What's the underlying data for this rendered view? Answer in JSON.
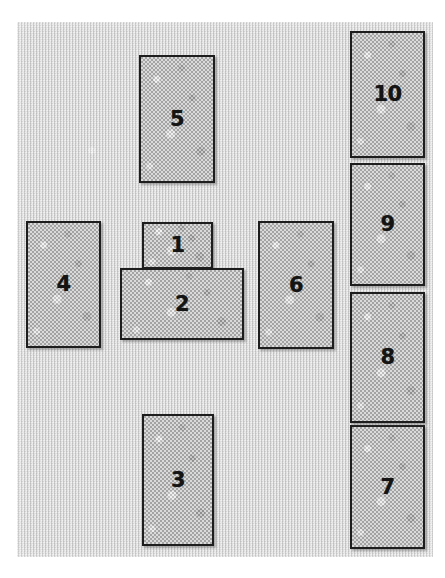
{
  "figure": {
    "canvas": {
      "width": 445,
      "height": 578
    },
    "colors": {
      "page_background": "#ffffff",
      "panel_fill": "#d6d6d6",
      "box_fill": "#b9b9b9",
      "box_border": "#1d1d1d",
      "label_text": "#141414"
    }
  },
  "panel": {
    "x": 17,
    "y": 22,
    "width": 416,
    "height": 535
  },
  "boxes": [
    {
      "id": "box-1",
      "label": "1",
      "x": 142,
      "y": 222,
      "width": 71,
      "height": 47,
      "overlap": false
    },
    {
      "id": "box-2",
      "label": "2",
      "x": 120,
      "y": 268,
      "width": 124,
      "height": 72,
      "overlap": true
    },
    {
      "id": "box-3",
      "label": "3",
      "x": 142,
      "y": 414,
      "width": 72,
      "height": 132,
      "overlap": false
    },
    {
      "id": "box-4",
      "label": "4",
      "x": 26,
      "y": 221,
      "width": 75,
      "height": 127,
      "overlap": false
    },
    {
      "id": "box-5",
      "label": "5",
      "x": 139,
      "y": 55,
      "width": 76,
      "height": 128,
      "overlap": false
    },
    {
      "id": "box-6",
      "label": "6",
      "x": 258,
      "y": 221,
      "width": 76,
      "height": 128,
      "overlap": false
    },
    {
      "id": "box-7",
      "label": "7",
      "x": 350,
      "y": 425,
      "width": 75,
      "height": 124,
      "overlap": false
    },
    {
      "id": "box-8",
      "label": "8",
      "x": 350,
      "y": 292,
      "width": 75,
      "height": 131,
      "overlap": false
    },
    {
      "id": "box-9",
      "label": "9",
      "x": 350,
      "y": 163,
      "width": 75,
      "height": 123,
      "overlap": false
    },
    {
      "id": "box-10",
      "label": "10",
      "x": 350,
      "y": 31,
      "width": 75,
      "height": 127,
      "overlap": false
    }
  ]
}
